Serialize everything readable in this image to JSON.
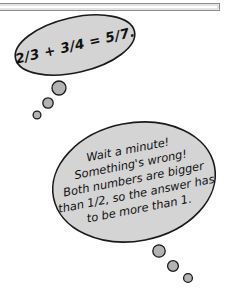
{
  "scene": {
    "title": "math-thought-bubbles-illustration",
    "background_color": "#ffffff",
    "width": 226,
    "height": 291
  },
  "frame": {
    "name": "page-border-frame",
    "stroke_color": "#8c8c8c"
  },
  "bubbles": [
    {
      "id": "equation-bubble",
      "fill_color": "#d4d4d4",
      "stroke_color": "#1a1a1a",
      "rotation_deg": -13,
      "lines": [
        "2/3 + 3/4 = 5/7."
      ],
      "text": "2/3 + 3/4 = 5/7."
    },
    {
      "id": "reasoning-bubble",
      "fill_color": "#d4d4d4",
      "stroke_color": "#1a1a1a",
      "rotation_deg": -11,
      "lines": [
        "Wait a minute!",
        "Something's wrong!",
        "Both numbers are bigger",
        "than 1/2, so the answer has",
        "to be more than 1."
      ],
      "text": "Wait a minute! Something's wrong! Both numbers are bigger than 1/2, so the answer has to be more than 1."
    }
  ],
  "thought_trails": [
    {
      "id": "upper-thought-trail",
      "dots": [
        {
          "cx": 59,
          "cy": 88,
          "r": 7.0
        },
        {
          "cx": 48,
          "cy": 103,
          "r": 5.2
        },
        {
          "cx": 37,
          "cy": 115,
          "r": 3.9
        }
      ]
    },
    {
      "id": "lower-thought-trail",
      "dots": [
        {
          "cx": 159,
          "cy": 251,
          "r": 6.2
        },
        {
          "cx": 173,
          "cy": 266,
          "r": 5.4
        },
        {
          "cx": 188,
          "cy": 278,
          "r": 4.4
        }
      ]
    }
  ],
  "colors": {
    "bubble_fill": "#d4d4d4",
    "outline": "#1a1a1a",
    "dot_fill": "#b3b3b3",
    "frame": "#8c8c8c",
    "background": "#ffffff"
  }
}
